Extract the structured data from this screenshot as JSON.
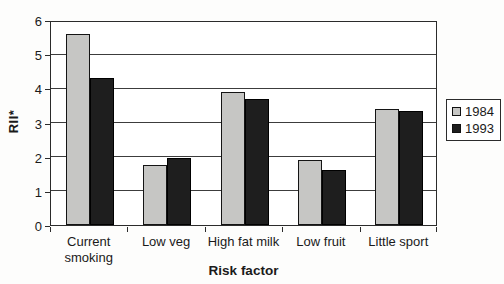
{
  "chart_data": {
    "type": "bar",
    "title": "",
    "xlabel": "Risk factor",
    "ylabel": "RII*",
    "categories": [
      "Current smoking",
      "Low veg",
      "High fat milk",
      "Low fruit",
      "Little sport"
    ],
    "series": [
      {
        "name": "1984",
        "color": "#c6c6c4",
        "border_color": "#141414",
        "values": [
          5.6,
          1.75,
          3.9,
          1.9,
          3.4
        ]
      },
      {
        "name": "1993",
        "color": "#1e1e1e",
        "border_color": "#000000",
        "values": [
          4.3,
          1.95,
          3.7,
          1.6,
          3.35
        ]
      }
    ],
    "ylim": [
      0,
      6
    ],
    "yticks": [
      0,
      1,
      2,
      3,
      4,
      5,
      6
    ],
    "grid": true,
    "legend_position": "right",
    "plot_border": true,
    "background_color": "#ffffff"
  }
}
